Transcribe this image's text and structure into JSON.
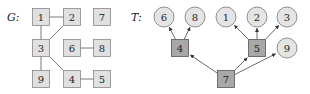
{
  "graph_g": {
    "label": "G:",
    "node_fill": "#e0e0e0",
    "node_stroke": "#888888",
    "nodes": [
      {
        "id": "1",
        "x": 41,
        "y": 17
      },
      {
        "id": "2",
        "x": 72,
        "y": 17
      },
      {
        "id": "7",
        "x": 102,
        "y": 17
      },
      {
        "id": "3",
        "x": 41,
        "y": 48
      },
      {
        "id": "6",
        "x": 72,
        "y": 48
      },
      {
        "id": "8",
        "x": 102,
        "y": 48
      },
      {
        "id": "9",
        "x": 41,
        "y": 79
      },
      {
        "id": "4",
        "x": 72,
        "y": 79
      },
      {
        "id": "5",
        "x": 102,
        "y": 79
      }
    ],
    "edges": [
      [
        "1",
        "2"
      ],
      [
        "1",
        "3"
      ],
      [
        "2",
        "3"
      ],
      [
        "3",
        "9"
      ],
      [
        "3",
        "4"
      ],
      [
        "4",
        "5"
      ],
      [
        "6",
        "8"
      ]
    ]
  },
  "graph_t": {
    "label": "T:",
    "leaf_fill": "#e4e4e4",
    "internal_fill": "#a8a8a8",
    "node_stroke": "#777777",
    "nodes": [
      {
        "id": "6",
        "x": 164,
        "y": 17,
        "shape": "circle"
      },
      {
        "id": "8",
        "x": 195,
        "y": 17,
        "shape": "circle"
      },
      {
        "id": "1",
        "x": 226,
        "y": 17,
        "shape": "circle"
      },
      {
        "id": "2",
        "x": 257,
        "y": 17,
        "shape": "circle"
      },
      {
        "id": "3",
        "x": 287,
        "y": 17,
        "shape": "circle"
      },
      {
        "id": "4",
        "x": 180,
        "y": 48,
        "shape": "square"
      },
      {
        "id": "5",
        "x": 257,
        "y": 48,
        "shape": "square"
      },
      {
        "id": "9",
        "x": 287,
        "y": 48,
        "shape": "circle"
      },
      {
        "id": "7",
        "x": 226,
        "y": 79,
        "shape": "square"
      }
    ],
    "edges": [
      [
        "7",
        "4"
      ],
      [
        "7",
        "5"
      ],
      [
        "7",
        "9"
      ],
      [
        "4",
        "6"
      ],
      [
        "4",
        "8"
      ],
      [
        "5",
        "1"
      ],
      [
        "5",
        "2"
      ],
      [
        "5",
        "3"
      ]
    ]
  }
}
